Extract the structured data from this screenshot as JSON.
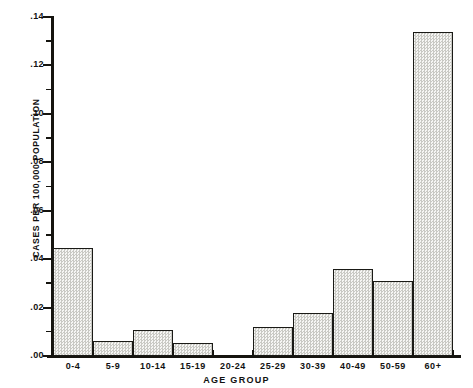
{
  "chart_data": {
    "type": "bar",
    "title": "",
    "subtitle": "",
    "xlabel": "AGE GROUP",
    "ylabel": "CASES PER 100,000 POPULATION",
    "categories": [
      "0-4",
      "5-9",
      "10-14",
      "15-19",
      "20-24",
      "25-29",
      "30-39",
      "40-49",
      "50-59",
      "60+"
    ],
    "values": [
      0.0445,
      0.006,
      0.0107,
      0.0055,
      0.0,
      0.012,
      0.0178,
      0.036,
      0.031,
      0.134
    ],
    "ylim": [
      0.0,
      0.14
    ],
    "xlim_categories": 10,
    "ytick_values": [
      0.0,
      0.02,
      0.04,
      0.06,
      0.08,
      0.1,
      0.12,
      0.14
    ],
    "ytick_labels": [
      ".00",
      ".02",
      ".04",
      ".06",
      ".08",
      ".10",
      ".12",
      ".14"
    ],
    "yminor_tick_values": [
      0.01,
      0.03,
      0.05,
      0.07,
      0.09,
      0.11,
      0.13
    ],
    "grid": false,
    "legend": null,
    "legend_position": "none",
    "bar_fill": "#ebebe8",
    "bar_edge": "#1a1a16",
    "axis_color": "#15140f",
    "background": "#ffffff",
    "annotations": []
  }
}
